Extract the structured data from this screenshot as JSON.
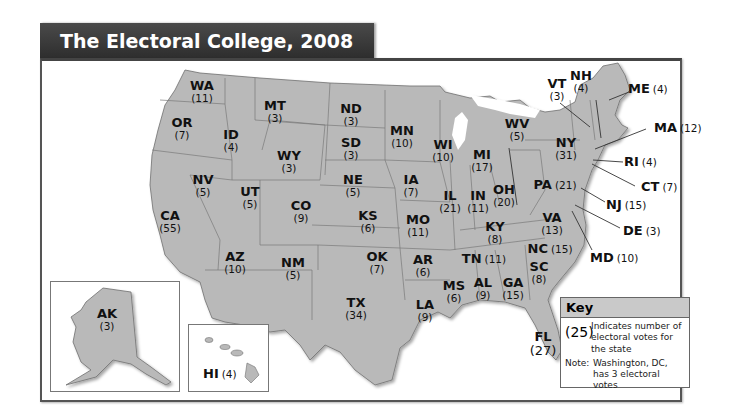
{
  "title": "The Electoral College, 2008",
  "colors": {
    "title_bar": "#333333",
    "state_fill": "#b9b9b9",
    "state_border": "#707070",
    "key_header": "#c9c9c9"
  },
  "states": [
    {
      "abbr": "WA",
      "votes": "(11)"
    },
    {
      "abbr": "OR",
      "votes": "(7)"
    },
    {
      "abbr": "ID",
      "votes": "(4)"
    },
    {
      "abbr": "MT",
      "votes": "(3)"
    },
    {
      "abbr": "ND",
      "votes": "(3)"
    },
    {
      "abbr": "SD",
      "votes": "(3)"
    },
    {
      "abbr": "WY",
      "votes": "(3)"
    },
    {
      "abbr": "NV",
      "votes": "(5)"
    },
    {
      "abbr": "UT",
      "votes": "(5)"
    },
    {
      "abbr": "CO",
      "votes": "(9)"
    },
    {
      "abbr": "NE",
      "votes": "(5)"
    },
    {
      "abbr": "KS",
      "votes": "(6)"
    },
    {
      "abbr": "CA",
      "votes": "(55)"
    },
    {
      "abbr": "AZ",
      "votes": "(10)"
    },
    {
      "abbr": "NM",
      "votes": "(5)"
    },
    {
      "abbr": "OK",
      "votes": "(7)"
    },
    {
      "abbr": "TX",
      "votes": "(34)"
    },
    {
      "abbr": "MN",
      "votes": "(10)"
    },
    {
      "abbr": "IA",
      "votes": "(7)"
    },
    {
      "abbr": "MO",
      "votes": "(11)"
    },
    {
      "abbr": "AR",
      "votes": "(6)"
    },
    {
      "abbr": "LA",
      "votes": "(9)"
    },
    {
      "abbr": "WI",
      "votes": "(10)"
    },
    {
      "abbr": "IL",
      "votes": "(21)"
    },
    {
      "abbr": "MI",
      "votes": "(17)"
    },
    {
      "abbr": "IN",
      "votes": "(11)"
    },
    {
      "abbr": "OH",
      "votes": "(20)"
    },
    {
      "abbr": "KY",
      "votes": "(8)"
    },
    {
      "abbr": "TN",
      "votes": "(11)"
    },
    {
      "abbr": "MS",
      "votes": "(6)"
    },
    {
      "abbr": "AL",
      "votes": "(9)"
    },
    {
      "abbr": "GA",
      "votes": "(15)"
    },
    {
      "abbr": "FL",
      "votes": "(27)"
    },
    {
      "abbr": "SC",
      "votes": "(8)"
    },
    {
      "abbr": "NC",
      "votes": "(15)"
    },
    {
      "abbr": "VA",
      "votes": "(13)"
    },
    {
      "abbr": "WV",
      "votes": "(5)"
    },
    {
      "abbr": "PA",
      "votes": "(21)"
    },
    {
      "abbr": "NY",
      "votes": "(31)"
    },
    {
      "abbr": "VT",
      "votes": "(3)"
    },
    {
      "abbr": "NH",
      "votes": "(4)"
    },
    {
      "abbr": "ME",
      "votes": "(4)"
    },
    {
      "abbr": "MA",
      "votes": "(12)"
    },
    {
      "abbr": "RI",
      "votes": "(4)"
    },
    {
      "abbr": "CT",
      "votes": "(7)"
    },
    {
      "abbr": "NJ",
      "votes": "(15)"
    },
    {
      "abbr": "DE",
      "votes": "(3)"
    },
    {
      "abbr": "MD",
      "votes": "(10)"
    },
    {
      "abbr": "AK",
      "votes": "(3)"
    },
    {
      "abbr": "HI",
      "votes": "(4)"
    }
  ],
  "key": {
    "title": "Key",
    "sample": "(25)",
    "description": "Indicates number of electoral votes for the state",
    "note_label": "Note:",
    "note_text": "Washington, DC, has 3 electoral votes"
  }
}
